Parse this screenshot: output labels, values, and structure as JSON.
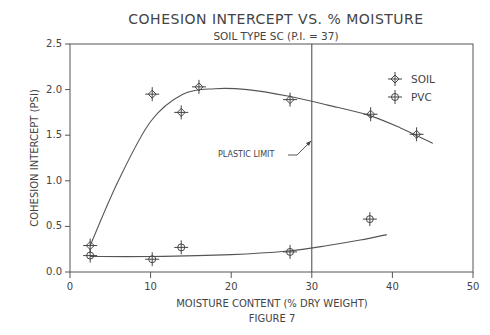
{
  "chart_data": {
    "type": "line",
    "title": "COHESION INTERCEPT VS. % MOISTURE",
    "subtitle": "SOIL TYPE SC (P.I. = 37)",
    "xlabel": "MOISTURE CONTENT (% DRY WEIGHT)",
    "ylabel": "COHESION INTERCEPT (PSI)",
    "caption": "FIGURE 7",
    "xlim": [
      0,
      50
    ],
    "ylim": [
      0.0,
      2.5
    ],
    "x_ticks": [
      "0",
      "10",
      "20",
      "30",
      "40",
      "50"
    ],
    "y_ticks": [
      "0.0",
      "0.5",
      "1.0",
      "1.5",
      "2.0",
      "2.5"
    ],
    "grid": false,
    "legend_position": "upper right",
    "series": [
      {
        "name": "SOIL",
        "marker": "crosshair-diamond",
        "points": [
          {
            "x": 2.5,
            "y": 0.29
          },
          {
            "x": 10.2,
            "y": 1.95
          },
          {
            "x": 13.8,
            "y": 1.75
          },
          {
            "x": 16.0,
            "y": 2.03
          },
          {
            "x": 27.3,
            "y": 1.89
          },
          {
            "x": 37.3,
            "y": 1.73
          },
          {
            "x": 43.0,
            "y": 1.51
          }
        ],
        "fit_curve": [
          {
            "x": 2.5,
            "y": 0.29
          },
          {
            "x": 6,
            "y": 1.0
          },
          {
            "x": 10,
            "y": 1.65
          },
          {
            "x": 14,
            "y": 1.95
          },
          {
            "x": 18,
            "y": 2.01
          },
          {
            "x": 22,
            "y": 2.0
          },
          {
            "x": 27,
            "y": 1.93
          },
          {
            "x": 32,
            "y": 1.83
          },
          {
            "x": 37,
            "y": 1.72
          },
          {
            "x": 41,
            "y": 1.58
          },
          {
            "x": 45,
            "y": 1.41
          }
        ]
      },
      {
        "name": "PVC",
        "marker": "crosshair-circle",
        "points": [
          {
            "x": 2.5,
            "y": 0.18
          },
          {
            "x": 10.2,
            "y": 0.14
          },
          {
            "x": 13.8,
            "y": 0.27
          },
          {
            "x": 27.3,
            "y": 0.22
          },
          {
            "x": 37.2,
            "y": 0.58
          }
        ],
        "fit_curve": [
          {
            "x": 2.5,
            "y": 0.17
          },
          {
            "x": 10,
            "y": 0.17
          },
          {
            "x": 20,
            "y": 0.19
          },
          {
            "x": 27,
            "y": 0.23
          },
          {
            "x": 32,
            "y": 0.29
          },
          {
            "x": 36,
            "y": 0.35
          },
          {
            "x": 39.3,
            "y": 0.41
          }
        ]
      }
    ],
    "annotations": [
      {
        "text": "PLASTIC LIMIT",
        "type": "vertical-line",
        "x": 30
      }
    ]
  }
}
